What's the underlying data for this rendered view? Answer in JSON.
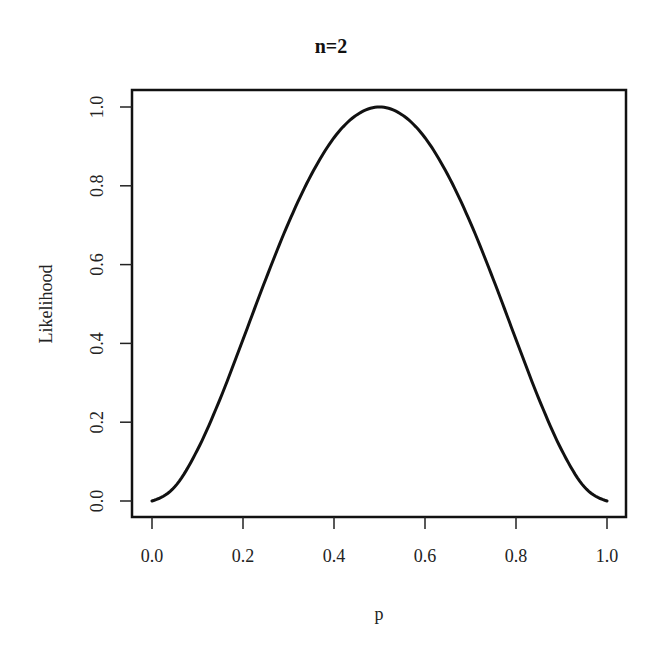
{
  "chart_data": {
    "type": "line",
    "title": "n=2",
    "xlabel": "p",
    "ylabel": "Likelihood",
    "xlim": [
      0.0,
      1.0
    ],
    "ylim": [
      0.0,
      1.0
    ],
    "grid": false,
    "legend": null,
    "x_ticks": [
      "0.0",
      "0.2",
      "0.4",
      "0.6",
      "0.8",
      "1.0"
    ],
    "y_ticks": [
      "0.0",
      "0.2",
      "0.4",
      "0.6",
      "0.8",
      "1.0"
    ],
    "series": [
      {
        "name": "Likelihood",
        "color": "#111111",
        "x": [
          0.0,
          0.05,
          0.1,
          0.15,
          0.2,
          0.25,
          0.3,
          0.35,
          0.4,
          0.45,
          0.5,
          0.55,
          0.6,
          0.65,
          0.7,
          0.75,
          0.8,
          0.85,
          0.9,
          0.95,
          1.0
        ],
        "y": [
          0.0,
          0.009,
          0.032,
          0.065,
          0.102,
          0.141,
          0.176,
          0.207,
          0.23,
          0.245,
          0.25,
          0.245,
          0.23,
          0.207,
          0.176,
          0.141,
          0.102,
          0.065,
          0.032,
          0.009,
          0.0
        ]
      }
    ],
    "values_normalized": [
      0.0,
      0.036,
      0.13,
      0.26,
      0.41,
      0.563,
      0.706,
      0.828,
      0.922,
      0.98,
      1.0,
      0.98,
      0.922,
      0.828,
      0.706,
      0.563,
      0.41,
      0.26,
      0.13,
      0.036,
      0.0
    ]
  },
  "labels": {
    "title": "n=2",
    "xlabel": "p",
    "ylabel": "Likelihood"
  }
}
